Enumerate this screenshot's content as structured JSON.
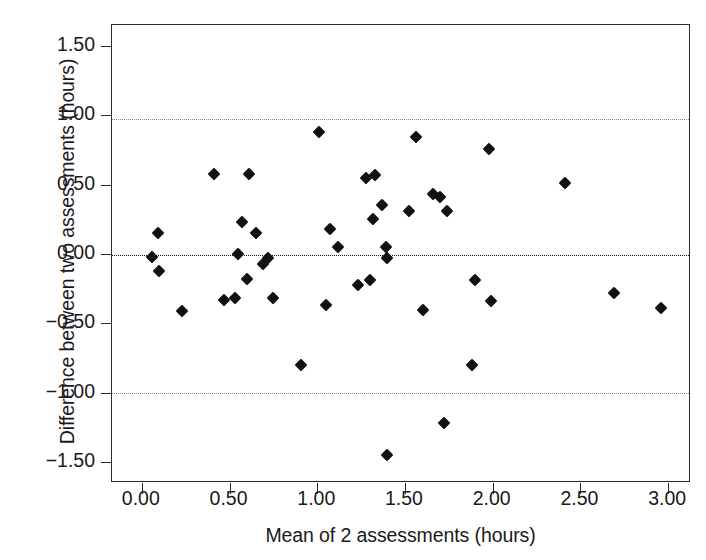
{
  "chart_data": {
    "type": "scatter",
    "title": "",
    "subtitle": "",
    "xlabel": "Mean of 2 assessments (hours)",
    "ylabel": "Difference between two assessments (hours)",
    "xlim": [
      -0.17,
      3.13
    ],
    "ylim": [
      -1.65,
      1.65
    ],
    "xticks": [
      0.0,
      0.5,
      1.0,
      1.5,
      2.0,
      2.5,
      3.0
    ],
    "xtick_labels": [
      "0.00",
      "0.50",
      "1.00",
      "1.50",
      "2.00",
      "2.50",
      "3.00"
    ],
    "yticks": [
      1.5,
      1.0,
      0.5,
      0.0,
      -0.5,
      -1.0,
      -1.5
    ],
    "ytick_labels": [
      "1.50",
      "1.00",
      "0.50",
      "0.00",
      "−0.50",
      "−1.00",
      "−1.50"
    ],
    "grid": false,
    "legend": null,
    "marker": "diamond",
    "marker_color": "#111111",
    "frame_color": "#2b2b2b",
    "reference_lines": [
      {
        "name": "upper-limit-of-agreement",
        "y": 0.97,
        "style": "dotted",
        "color": "#8a8a8a"
      },
      {
        "name": "mean-difference",
        "y": -0.01,
        "style": "dotted",
        "color": "#121212"
      },
      {
        "name": "lower-limit-of-agreement",
        "y": -1.0,
        "style": "dotted",
        "color": "#8a8a8a"
      }
    ],
    "points": [
      {
        "x": 0.06,
        "y": -0.02
      },
      {
        "x": 0.09,
        "y": 0.15
      },
      {
        "x": 0.1,
        "y": -0.12
      },
      {
        "x": 0.23,
        "y": -0.41
      },
      {
        "x": 0.41,
        "y": 0.58
      },
      {
        "x": 0.47,
        "y": -0.33
      },
      {
        "x": 0.53,
        "y": -0.32
      },
      {
        "x": 0.55,
        "y": 0.0
      },
      {
        "x": 0.57,
        "y": 0.23
      },
      {
        "x": 0.6,
        "y": -0.18
      },
      {
        "x": 0.61,
        "y": 0.58
      },
      {
        "x": 0.65,
        "y": 0.15
      },
      {
        "x": 0.69,
        "y": -0.07
      },
      {
        "x": 0.72,
        "y": -0.03
      },
      {
        "x": 0.75,
        "y": -0.32
      },
      {
        "x": 0.91,
        "y": -0.8
      },
      {
        "x": 1.01,
        "y": 0.88
      },
      {
        "x": 1.05,
        "y": -0.37
      },
      {
        "x": 1.07,
        "y": 0.18
      },
      {
        "x": 1.12,
        "y": 0.05
      },
      {
        "x": 1.23,
        "y": -0.22
      },
      {
        "x": 1.28,
        "y": 0.55
      },
      {
        "x": 1.3,
        "y": -0.19
      },
      {
        "x": 1.32,
        "y": 0.25
      },
      {
        "x": 1.33,
        "y": 0.57
      },
      {
        "x": 1.37,
        "y": 0.35
      },
      {
        "x": 1.39,
        "y": 0.05
      },
      {
        "x": 1.4,
        "y": -0.03
      },
      {
        "x": 1.4,
        "y": -1.45
      },
      {
        "x": 1.52,
        "y": 0.31
      },
      {
        "x": 1.56,
        "y": 0.84
      },
      {
        "x": 1.6,
        "y": -0.4
      },
      {
        "x": 1.66,
        "y": 0.43
      },
      {
        "x": 1.7,
        "y": 0.41
      },
      {
        "x": 1.72,
        "y": -1.22
      },
      {
        "x": 1.74,
        "y": 0.31
      },
      {
        "x": 1.88,
        "y": -0.8
      },
      {
        "x": 1.9,
        "y": -0.19
      },
      {
        "x": 1.98,
        "y": 0.76
      },
      {
        "x": 1.99,
        "y": -0.34
      },
      {
        "x": 2.41,
        "y": 0.51
      },
      {
        "x": 2.69,
        "y": -0.28
      },
      {
        "x": 2.96,
        "y": -0.39
      }
    ]
  }
}
